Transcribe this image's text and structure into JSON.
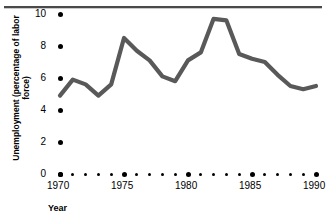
{
  "chart_data": {
    "type": "line",
    "title": "",
    "xlabel": "Year",
    "ylabel": "Unemployment (percentage of labor force)",
    "xlim": [
      1970,
      1990
    ],
    "ylim": [
      0,
      10
    ],
    "grid": false,
    "legend": "none",
    "line_color": "#595959",
    "categories": [
      1970,
      1971,
      1972,
      1973,
      1974,
      1975,
      1976,
      1977,
      1978,
      1979,
      1980,
      1981,
      1982,
      1983,
      1984,
      1985,
      1986,
      1987,
      1988,
      1989,
      1990
    ],
    "x": [
      1970,
      1971,
      1972,
      1973,
      1974,
      1975,
      1976,
      1977,
      1978,
      1979,
      1980,
      1981,
      1982,
      1983,
      1984,
      1985,
      1986,
      1987,
      1988,
      1989,
      1990
    ],
    "values": [
      4.9,
      5.9,
      5.6,
      4.9,
      5.6,
      8.5,
      7.7,
      7.1,
      6.1,
      5.8,
      7.1,
      7.6,
      9.7,
      9.6,
      7.5,
      7.2,
      7.0,
      6.2,
      5.5,
      5.3,
      5.5
    ],
    "series": [
      {
        "name": "Unemployment rate",
        "values": [
          4.9,
          5.9,
          5.6,
          4.9,
          5.6,
          8.5,
          7.7,
          7.1,
          6.1,
          5.8,
          7.1,
          7.6,
          9.7,
          9.6,
          7.5,
          7.2,
          7.0,
          6.2,
          5.5,
          5.3,
          5.5
        ]
      }
    ],
    "ytick_labels": [
      "0",
      "2",
      "4",
      "6",
      "8",
      "10"
    ],
    "ytick_values": [
      0,
      2,
      4,
      6,
      8,
      10
    ],
    "xtick_labels": [
      "1970",
      "1975",
      "1980",
      "1985",
      "1990"
    ],
    "xtick_values": [
      1970,
      1975,
      1980,
      1985,
      1990
    ],
    "xtick_minor_values": [
      1971,
      1972,
      1973,
      1974,
      1976,
      1977,
      1978,
      1979,
      1981,
      1982,
      1983,
      1984,
      1986,
      1987,
      1988,
      1989
    ]
  },
  "axes": {
    "y_title": "Unemployment (percentage of labor force)",
    "x_title": "Year"
  }
}
